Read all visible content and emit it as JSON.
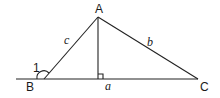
{
  "diagram": {
    "type": "triangle-with-altitude",
    "vertices": [
      {
        "name": "A",
        "x": 98,
        "y": 17
      },
      {
        "name": "B",
        "x": 44,
        "y": 79
      },
      {
        "name": "C",
        "x": 198,
        "y": 79
      }
    ],
    "vertex_labels": {
      "A": "A",
      "B": "B",
      "C": "C"
    },
    "side_labels": {
      "a": "a",
      "b": "b",
      "c": "c"
    },
    "angle_label": "1",
    "altitude": {
      "from": "A",
      "foot_x": 98,
      "foot_y": 79,
      "right_angle_marker": true
    },
    "baseline": {
      "x1": 16,
      "x2": 198,
      "y": 79,
      "extends_left_of": "B"
    },
    "colors": {
      "stroke": "#222222",
      "background": "#ffffff"
    }
  }
}
